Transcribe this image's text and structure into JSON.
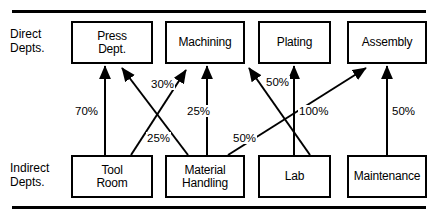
{
  "figure": {
    "width": 438,
    "height": 211,
    "background": "#ffffff",
    "line_color": "#000000"
  },
  "row_labels": [
    {
      "name": "direct-depts",
      "text": "Direct\nDepts.",
      "x": 10,
      "y": 28
    },
    {
      "name": "indirect-depts",
      "text": "Indirect\nDepts.",
      "x": 10,
      "y": 162
    }
  ],
  "nodes": {
    "direct": [
      {
        "id": "press",
        "label": "Press\nDept.",
        "x": 71,
        "y": 21,
        "w": 82,
        "h": 43
      },
      {
        "id": "machining",
        "label": "Machining",
        "x": 165,
        "y": 21,
        "w": 80,
        "h": 43
      },
      {
        "id": "plating",
        "label": "Plating",
        "x": 258,
        "y": 21,
        "w": 73,
        "h": 43
      },
      {
        "id": "assembly",
        "label": "Assembly",
        "x": 347,
        "y": 21,
        "w": 80,
        "h": 43
      }
    ],
    "indirect": [
      {
        "id": "tool-room",
        "label": "Tool\nRoom",
        "x": 71,
        "y": 155,
        "w": 82,
        "h": 43
      },
      {
        "id": "material-handling",
        "label": "Material\nHandling",
        "x": 165,
        "y": 155,
        "w": 80,
        "h": 43
      },
      {
        "id": "lab",
        "label": "Lab",
        "x": 258,
        "y": 155,
        "w": 73,
        "h": 43
      },
      {
        "id": "maintenance",
        "label": "Maintenance",
        "x": 347,
        "y": 155,
        "w": 80,
        "h": 43
      }
    ]
  },
  "edges": [
    {
      "id": "tool-room-to-press",
      "from": "tool-room",
      "to": "press",
      "percent": "70%",
      "x1": 105,
      "y1": 155,
      "x2": 105,
      "y2": 66,
      "label_x": 74,
      "label_y": 105
    },
    {
      "id": "tool-room-to-machining",
      "from": "tool-room",
      "to": "machining",
      "percent": "30%",
      "x1": 131,
      "y1": 155,
      "x2": 186,
      "y2": 70,
      "label_x": 150,
      "label_y": 78
    },
    {
      "id": "material-handling-to-press",
      "from": "material-handling",
      "to": "press",
      "percent": "25%",
      "x1": 188,
      "y1": 155,
      "x2": 122,
      "y2": 68,
      "label_x": 146,
      "label_y": 132
    },
    {
      "id": "material-handling-to-machining",
      "from": "material-handling",
      "to": "machining",
      "percent": "25%",
      "x1": 207,
      "y1": 155,
      "x2": 207,
      "y2": 66,
      "label_x": 186,
      "label_y": 105
    },
    {
      "id": "material-handling-to-assembly",
      "from": "material-handling",
      "to": "assembly",
      "percent": "50%",
      "x1": 228,
      "y1": 155,
      "x2": 366,
      "y2": 68,
      "label_x": 232,
      "label_y": 132
    },
    {
      "id": "lab-to-machining",
      "from": "lab",
      "to": "machining",
      "percent": "50%",
      "x1": 310,
      "y1": 155,
      "x2": 249,
      "y2": 68,
      "label_x": 265,
      "label_y": 76
    },
    {
      "id": "lab-to-plating",
      "from": "lab",
      "to": "plating",
      "percent": "100%",
      "x1": 294,
      "y1": 155,
      "x2": 294,
      "y2": 66,
      "label_x": 298,
      "label_y": 105
    },
    {
      "id": "maintenance-to-assembly",
      "from": "maintenance",
      "to": "assembly",
      "percent": "50%",
      "x1": 387,
      "y1": 155,
      "x2": 387,
      "y2": 66,
      "label_x": 391,
      "label_y": 105
    }
  ],
  "rules": [
    {
      "name": "top-rule",
      "y": 10
    },
    {
      "name": "bottom-rule",
      "y": 206
    }
  ]
}
